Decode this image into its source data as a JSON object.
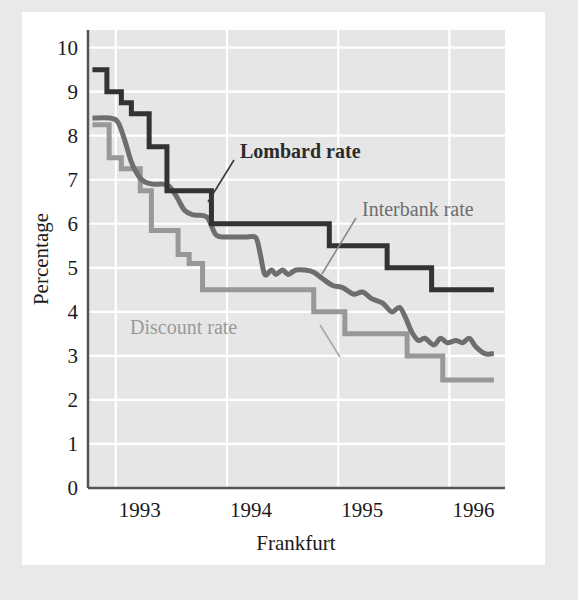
{
  "chart_data": {
    "type": "line",
    "title": "",
    "xlabel": "Frankfurt",
    "ylabel": "Percentage",
    "xlim": [
      1992.75,
      1996.5
    ],
    "ylim": [
      0,
      10.4
    ],
    "yticks": [
      "0",
      "1",
      "2",
      "3",
      "4",
      "5",
      "6",
      "7",
      "8",
      "9",
      "10"
    ],
    "ytick_values": [
      0,
      1,
      2,
      3,
      4,
      5,
      6,
      7,
      8,
      9,
      10
    ],
    "xticks": [
      "1993",
      "1994",
      "1995",
      "1996"
    ],
    "xtick_values": [
      1993,
      1994,
      1995,
      1996
    ],
    "grid": "horizontal-and-vertical-white-on-gray",
    "legend_position": "inline-annotations",
    "series": [
      {
        "name": "Lombard rate",
        "color": "#333333",
        "style": "step",
        "width": 5,
        "points": [
          [
            1992.79,
            9.5
          ],
          [
            1992.92,
            9.5
          ],
          [
            1992.92,
            9.0
          ],
          [
            1993.05,
            9.0
          ],
          [
            1993.05,
            8.75
          ],
          [
            1993.14,
            8.75
          ],
          [
            1993.14,
            8.5
          ],
          [
            1993.3,
            8.5
          ],
          [
            1993.3,
            7.75
          ],
          [
            1993.46,
            7.75
          ],
          [
            1993.46,
            6.75
          ],
          [
            1993.86,
            6.75
          ],
          [
            1993.86,
            6.0
          ],
          [
            1994.92,
            6.0
          ],
          [
            1994.92,
            5.5
          ],
          [
            1995.44,
            5.5
          ],
          [
            1995.44,
            5.0
          ],
          [
            1995.84,
            5.0
          ],
          [
            1995.84,
            4.5
          ],
          [
            1996.4,
            4.5
          ]
        ]
      },
      {
        "name": "Interbank rate",
        "color": "#6e6e6e",
        "style": "smooth",
        "width": 5,
        "points": [
          [
            1992.79,
            8.4
          ],
          [
            1992.95,
            8.4
          ],
          [
            1993.02,
            8.3
          ],
          [
            1993.08,
            7.9
          ],
          [
            1993.14,
            7.4
          ],
          [
            1993.2,
            7.1
          ],
          [
            1993.26,
            6.95
          ],
          [
            1993.33,
            6.9
          ],
          [
            1993.42,
            6.9
          ],
          [
            1993.48,
            6.85
          ],
          [
            1993.55,
            6.6
          ],
          [
            1993.62,
            6.3
          ],
          [
            1993.7,
            6.2
          ],
          [
            1993.82,
            6.15
          ],
          [
            1993.9,
            5.75
          ],
          [
            1994.0,
            5.7
          ],
          [
            1994.18,
            5.7
          ],
          [
            1994.26,
            5.68
          ],
          [
            1994.3,
            5.3
          ],
          [
            1994.34,
            4.85
          ],
          [
            1994.4,
            4.95
          ],
          [
            1994.44,
            4.85
          ],
          [
            1994.5,
            4.95
          ],
          [
            1994.55,
            4.85
          ],
          [
            1994.62,
            4.95
          ],
          [
            1994.7,
            4.95
          ],
          [
            1994.78,
            4.9
          ],
          [
            1994.86,
            4.75
          ],
          [
            1994.95,
            4.6
          ],
          [
            1995.04,
            4.55
          ],
          [
            1995.14,
            4.4
          ],
          [
            1995.22,
            4.45
          ],
          [
            1995.3,
            4.3
          ],
          [
            1995.4,
            4.2
          ],
          [
            1995.48,
            4.0
          ],
          [
            1995.55,
            4.1
          ],
          [
            1995.6,
            3.9
          ],
          [
            1995.66,
            3.55
          ],
          [
            1995.72,
            3.35
          ],
          [
            1995.78,
            3.4
          ],
          [
            1995.86,
            3.25
          ],
          [
            1995.92,
            3.4
          ],
          [
            1995.98,
            3.3
          ],
          [
            1996.06,
            3.35
          ],
          [
            1996.12,
            3.3
          ],
          [
            1996.18,
            3.4
          ],
          [
            1996.24,
            3.2
          ],
          [
            1996.32,
            3.05
          ],
          [
            1996.4,
            3.05
          ]
        ]
      },
      {
        "name": "Discount rate",
        "color": "#989898",
        "style": "step",
        "width": 5,
        "points": [
          [
            1992.79,
            8.25
          ],
          [
            1992.94,
            8.25
          ],
          [
            1992.94,
            7.5
          ],
          [
            1993.05,
            7.5
          ],
          [
            1993.05,
            7.25
          ],
          [
            1993.22,
            7.25
          ],
          [
            1993.22,
            6.75
          ],
          [
            1993.32,
            6.75
          ],
          [
            1993.32,
            5.85
          ],
          [
            1993.56,
            5.85
          ],
          [
            1993.56,
            5.3
          ],
          [
            1993.66,
            5.3
          ],
          [
            1993.66,
            5.1
          ],
          [
            1993.78,
            5.1
          ],
          [
            1993.78,
            4.5
          ],
          [
            1994.78,
            4.5
          ],
          [
            1994.78,
            4.0
          ],
          [
            1995.06,
            4.0
          ],
          [
            1995.06,
            3.5
          ],
          [
            1995.62,
            3.5
          ],
          [
            1995.62,
            3.0
          ],
          [
            1995.94,
            3.0
          ],
          [
            1995.94,
            2.45
          ],
          [
            1996.4,
            2.45
          ]
        ]
      }
    ],
    "annotations": [
      {
        "text": "Lombard rate",
        "series": "Lombard rate"
      },
      {
        "text": "Interbank rate",
        "series": "Interbank rate"
      },
      {
        "text": "Discount rate",
        "series": "Discount rate"
      }
    ]
  },
  "chart": {
    "ylabel": "Percentage",
    "xlabel": "Frankfurt",
    "ann_lombard": "Lombard rate",
    "ann_interbank": "Interbank rate",
    "ann_discount": "Discount rate",
    "yticks": [
      "10",
      "9",
      "8",
      "7",
      "6",
      "5",
      "4",
      "3",
      "2",
      "1",
      "0"
    ],
    "xticks": [
      "1993",
      "1994",
      "1995",
      "1996"
    ],
    "colors": {
      "plot_background": "#e6e6e6",
      "gridline": "#ffffff",
      "axis": "#555555",
      "lombard": "#333333",
      "interbank": "#6e6e6e",
      "discount": "#989898",
      "page_background": "#e9e9e9",
      "card_background": "#ffffff"
    }
  }
}
